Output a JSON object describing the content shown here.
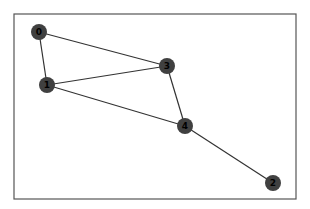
{
  "figure": {
    "frame": {
      "x": 14,
      "y": 14,
      "width": 282,
      "height": 185,
      "stroke": "#555555"
    },
    "node_color": "#404040",
    "edge_color": "#333333",
    "label_color": "#000000",
    "node_radius": 8
  },
  "graph": {
    "nodes": [
      {
        "id": "0",
        "label": "0",
        "x": 39,
        "y": 32
      },
      {
        "id": "1",
        "label": "1",
        "x": 47,
        "y": 85
      },
      {
        "id": "2",
        "label": "2",
        "x": 273,
        "y": 183
      },
      {
        "id": "3",
        "label": "3",
        "x": 167,
        "y": 66
      },
      {
        "id": "4",
        "label": "4",
        "x": 185,
        "y": 126
      }
    ],
    "edges": [
      {
        "source": "0",
        "target": "1"
      },
      {
        "source": "0",
        "target": "3"
      },
      {
        "source": "1",
        "target": "3"
      },
      {
        "source": "1",
        "target": "4"
      },
      {
        "source": "3",
        "target": "4"
      },
      {
        "source": "4",
        "target": "2"
      }
    ]
  }
}
